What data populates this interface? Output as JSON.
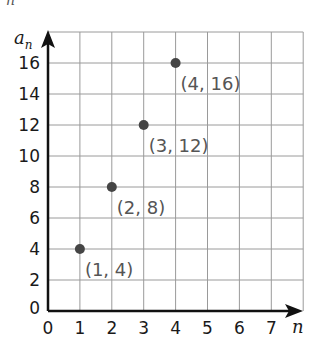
{
  "top_fragment": "n",
  "chart_data": {
    "type": "scatter",
    "title": "",
    "xlabel": "n",
    "ylabel": "a_n",
    "ylabel_main": "a",
    "ylabel_sub": "n",
    "xlim": [
      0,
      8
    ],
    "ylim": [
      0,
      18
    ],
    "grid": true,
    "x_ticks": [
      0,
      1,
      2,
      3,
      4,
      5,
      6,
      7
    ],
    "y_ticks": [
      0,
      2,
      4,
      6,
      8,
      10,
      12,
      14,
      16
    ],
    "series": [
      {
        "name": "a_n",
        "points": [
          {
            "x": 1,
            "y": 4,
            "label": "(1, 4)"
          },
          {
            "x": 2,
            "y": 8,
            "label": "(2, 8)"
          },
          {
            "x": 3,
            "y": 12,
            "label": "(3, 12)"
          },
          {
            "x": 4,
            "y": 16,
            "label": "(4, 16)"
          }
        ]
      }
    ],
    "colors": {
      "grid": "#9a9a9a",
      "axis": "#111111",
      "point": "#454545",
      "point_label": "#555555"
    }
  }
}
